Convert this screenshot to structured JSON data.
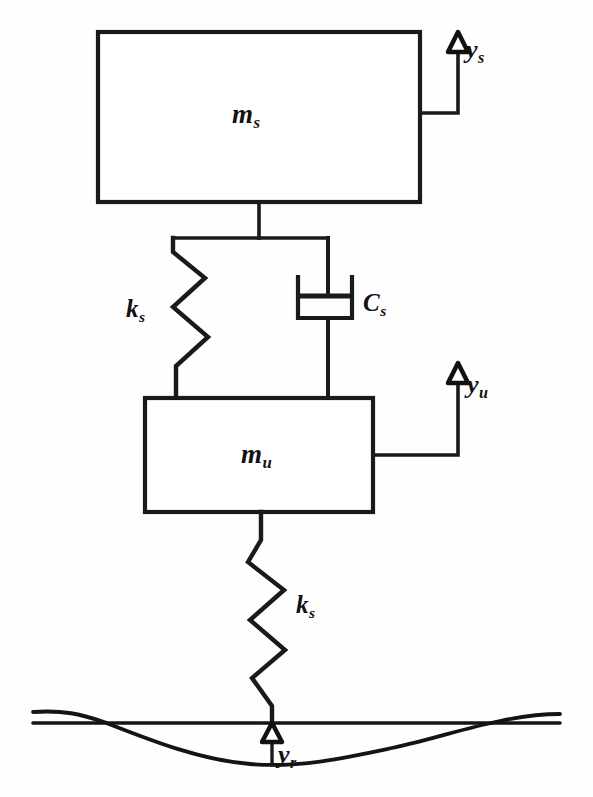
{
  "diagram": {
    "type": "schematic",
    "background_color": "#fefefe",
    "line_color": "#1a1a1a",
    "labels": {
      "sprung_mass": {
        "base": "m",
        "sub": "s"
      },
      "unsprung_mass": {
        "base": "m",
        "sub": "u"
      },
      "suspension_spring": {
        "base": "k",
        "sub": "s"
      },
      "tire_spring": {
        "base": "k",
        "sub": "s"
      },
      "suspension_damper": {
        "base": "C",
        "sub": "s"
      },
      "sprung_displacement": {
        "base": "y",
        "sub": "s"
      },
      "unsprung_displacement": {
        "base": "y",
        "sub": "u"
      },
      "road_displacement": {
        "base": "y",
        "sub": "r"
      }
    },
    "components": [
      {
        "name": "sprung-mass-block",
        "label": "m_s",
        "kind": "rectangle"
      },
      {
        "name": "unsprung-mass-block",
        "label": "m_u",
        "kind": "rectangle"
      },
      {
        "name": "suspension-spring",
        "label": "k_s",
        "kind": "zigzag-spring"
      },
      {
        "name": "suspension-damper",
        "label": "C_s",
        "kind": "dashpot"
      },
      {
        "name": "tire-spring",
        "label": "k_s",
        "kind": "zigzag-spring"
      },
      {
        "name": "road-surface",
        "label": "y_r",
        "kind": "wavy-profile"
      }
    ],
    "geometry": {
      "sprung_box": {
        "x": 98,
        "y": 32,
        "w": 322,
        "h": 170
      },
      "unsprung_box": {
        "x": 145,
        "y": 398,
        "w": 228,
        "h": 114
      },
      "damper_cylinder": {
        "x": 298,
        "y": 277,
        "w": 54,
        "h": 41
      },
      "ground_line_y": 723,
      "road_dip_depth": 40
    }
  },
  "caption": " "
}
